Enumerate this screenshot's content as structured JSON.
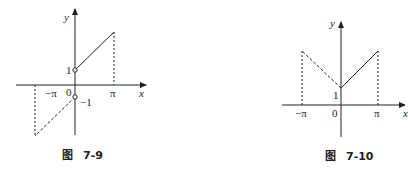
{
  "figures": [
    {
      "id": "fig-7-9",
      "caption_prefix": "图",
      "caption_number": "7-9",
      "axis_labels": {
        "x": "x",
        "y": "y"
      },
      "tick_labels": {
        "neg_pi": "−π",
        "pi": "π",
        "origin": "0",
        "one": "1",
        "neg_one": "−1"
      }
    },
    {
      "id": "fig-7-10",
      "caption_prefix": "图",
      "caption_number": "7-10",
      "axis_labels": {
        "x": "x",
        "y": "y"
      },
      "tick_labels": {
        "neg_pi": "−π",
        "pi": "π",
        "origin": "0",
        "one": "1"
      }
    }
  ],
  "colors": {
    "ink": "#222222",
    "background": "#ffffff"
  }
}
